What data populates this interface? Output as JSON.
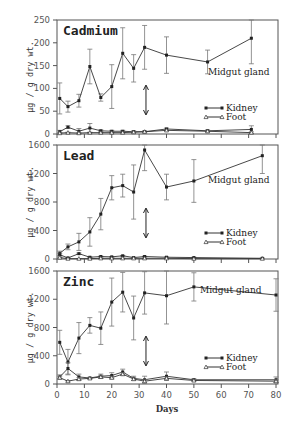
{
  "chart_data": [
    {
      "type": "line",
      "title": "Cadmium",
      "xlabel": "Days",
      "ylabel": "µg / g dry wt.",
      "xlim": [
        0,
        80
      ],
      "ylim": [
        0,
        250
      ],
      "yticks": [
        0,
        50,
        100,
        150,
        200,
        250
      ],
      "annotation": "Midgut gland",
      "legend": [
        "Kidney",
        "Foot"
      ],
      "series": [
        {
          "name": "Midgut gland",
          "x": [
            1,
            4,
            8,
            12,
            16,
            20,
            24,
            28,
            32,
            40,
            55,
            71
          ],
          "values": [
            78,
            60,
            73,
            148,
            80,
            104,
            177,
            144,
            190,
            173,
            158,
            210
          ],
          "err": [
            34,
            12,
            14,
            38,
            8,
            48,
            56,
            30,
            48,
            40,
            26,
            56
          ]
        },
        {
          "name": "Kidney",
          "x": [
            1,
            4,
            8,
            12,
            16,
            20,
            24,
            28,
            32,
            40,
            55,
            71
          ],
          "values": [
            5,
            15,
            6,
            13,
            7,
            6,
            6,
            5,
            5,
            11,
            7,
            10
          ],
          "err": [
            3,
            3,
            6,
            10,
            2,
            2,
            2,
            2,
            2,
            2,
            2,
            8
          ]
        },
        {
          "name": "Foot",
          "x": [
            1,
            4,
            8,
            12,
            16,
            20,
            24,
            28,
            32,
            40,
            55,
            71
          ],
          "values": [
            2,
            3,
            2,
            3,
            3,
            3,
            3,
            4,
            5,
            8,
            6,
            3
          ],
          "err": [
            1,
            1,
            1,
            1,
            1,
            1,
            1,
            1,
            1,
            1,
            1,
            2
          ]
        }
      ]
    },
    {
      "type": "line",
      "title": "Lead",
      "xlabel": "Days",
      "ylabel": "µg / g dry wt.",
      "xlim": [
        0,
        80
      ],
      "ylim": [
        0,
        1600
      ],
      "yticks": [
        0,
        400,
        800,
        1200,
        1600
      ],
      "annotation": "Midgut gland",
      "legend": [
        "Kidney",
        "Foot"
      ],
      "series": [
        {
          "name": "Midgut gland",
          "x": [
            1,
            4,
            8,
            12,
            16,
            20,
            24,
            28,
            32,
            40,
            50,
            75
          ],
          "values": [
            80,
            170,
            240,
            380,
            630,
            1000,
            1030,
            940,
            1530,
            1010,
            1095,
            1450
          ],
          "err": [
            30,
            40,
            120,
            200,
            220,
            170,
            160,
            380,
            290,
            180,
            300,
            250
          ]
        },
        {
          "name": "Kidney",
          "x": [
            1,
            4,
            8,
            12,
            16,
            20,
            24,
            28,
            32,
            40,
            50,
            75
          ],
          "values": [
            60,
            15,
            75,
            25,
            35,
            30,
            45,
            20,
            35,
            25,
            20,
            10
          ],
          "err": [
            20,
            5,
            10,
            5,
            5,
            5,
            5,
            5,
            5,
            5,
            5,
            5
          ]
        },
        {
          "name": "Foot",
          "x": [
            1,
            4,
            8,
            12,
            16,
            20,
            24,
            28,
            32,
            40,
            50,
            75
          ],
          "values": [
            20,
            5,
            5,
            5,
            10,
            10,
            10,
            10,
            10,
            10,
            5,
            5
          ],
          "err": [
            5,
            2,
            2,
            2,
            2,
            2,
            2,
            2,
            2,
            2,
            2,
            2
          ]
        }
      ]
    },
    {
      "type": "line",
      "title": "Zinc",
      "xlabel": "Days",
      "ylabel": "µg / g dry wt.",
      "xlim": [
        0,
        80
      ],
      "xticks": [
        0,
        10,
        20,
        30,
        40,
        50,
        60,
        70,
        80
      ],
      "ylim": [
        0,
        1600
      ],
      "yticks": [
        0,
        400,
        800,
        1200,
        1600
      ],
      "annotation": "Midgut gland",
      "legend": [
        "Kidney",
        "Foot"
      ],
      "series": [
        {
          "name": "Midgut gland",
          "x": [
            1,
            4,
            8,
            12,
            16,
            20,
            24,
            28,
            32,
            40,
            50,
            80
          ],
          "values": [
            590,
            310,
            650,
            830,
            790,
            1160,
            1300,
            935,
            1290,
            1250,
            1375,
            1260
          ],
          "err": [
            170,
            180,
            220,
            110,
            230,
            340,
            280,
            310,
            300,
            400,
            200,
            230
          ]
        },
        {
          "name": "Kidney",
          "x": [
            1,
            4,
            8,
            12,
            16,
            20,
            24,
            28,
            32,
            40,
            50,
            80
          ],
          "values": [
            100,
            220,
            100,
            85,
            110,
            120,
            170,
            80,
            60,
            110,
            60,
            60
          ],
          "err": [
            30,
            80,
            40,
            10,
            30,
            40,
            40,
            30,
            50,
            60,
            15,
            40
          ]
        },
        {
          "name": "Foot",
          "x": [
            1,
            4,
            8,
            12,
            16,
            20,
            24,
            28,
            32,
            40,
            50,
            80
          ],
          "values": [
            90,
            40,
            70,
            80,
            100,
            90,
            140,
            70,
            40,
            80,
            50,
            40
          ],
          "err": [
            20,
            10,
            20,
            10,
            20,
            20,
            20,
            20,
            20,
            20,
            10,
            20
          ]
        }
      ]
    }
  ]
}
